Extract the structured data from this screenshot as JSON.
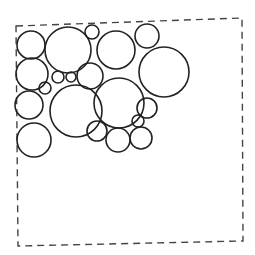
{
  "diagram": {
    "title": "",
    "stroke_color": "#222222",
    "border_color": "#444444",
    "background": "#ffffff",
    "boundary": {
      "style": "dashed",
      "points": [
        [
          16,
          26
        ],
        [
          242,
          18
        ],
        [
          243,
          241
        ],
        [
          18,
          246
        ]
      ]
    },
    "circles": [
      {
        "id": "A",
        "cx": 31,
        "cy": 45,
        "r": 14
      },
      {
        "id": "B",
        "cx": 68,
        "cy": 50,
        "r": 23
      },
      {
        "id": "C",
        "cx": 92,
        "cy": 32,
        "r": 7
      },
      {
        "id": "D",
        "cx": 116,
        "cy": 50,
        "r": 19
      },
      {
        "id": "E",
        "cx": 147,
        "cy": 36,
        "r": 12
      },
      {
        "id": "F",
        "cx": 164,
        "cy": 72,
        "r": 25
      },
      {
        "id": "G",
        "cx": 32,
        "cy": 74,
        "r": 16
      },
      {
        "id": "H",
        "cx": 58,
        "cy": 77,
        "r": 6
      },
      {
        "id": "I",
        "cx": 71,
        "cy": 77,
        "r": 5
      },
      {
        "id": "J",
        "cx": 90,
        "cy": 76,
        "r": 13
      },
      {
        "id": "K",
        "cx": 45,
        "cy": 88,
        "r": 6
      },
      {
        "id": "L",
        "cx": 76,
        "cy": 111,
        "r": 26
      },
      {
        "id": "M",
        "cx": 119,
        "cy": 103,
        "r": 25
      },
      {
        "id": "N",
        "cx": 29,
        "cy": 105,
        "r": 14
      },
      {
        "id": "O",
        "cx": 147,
        "cy": 108,
        "r": 10
      },
      {
        "id": "P",
        "cx": 138,
        "cy": 121,
        "r": 6
      },
      {
        "id": "Q",
        "cx": 34,
        "cy": 140,
        "r": 17
      },
      {
        "id": "R",
        "cx": 97,
        "cy": 131,
        "r": 10
      },
      {
        "id": "S",
        "cx": 118,
        "cy": 140,
        "r": 12
      },
      {
        "id": "T",
        "cx": 141,
        "cy": 138,
        "r": 11
      }
    ]
  }
}
